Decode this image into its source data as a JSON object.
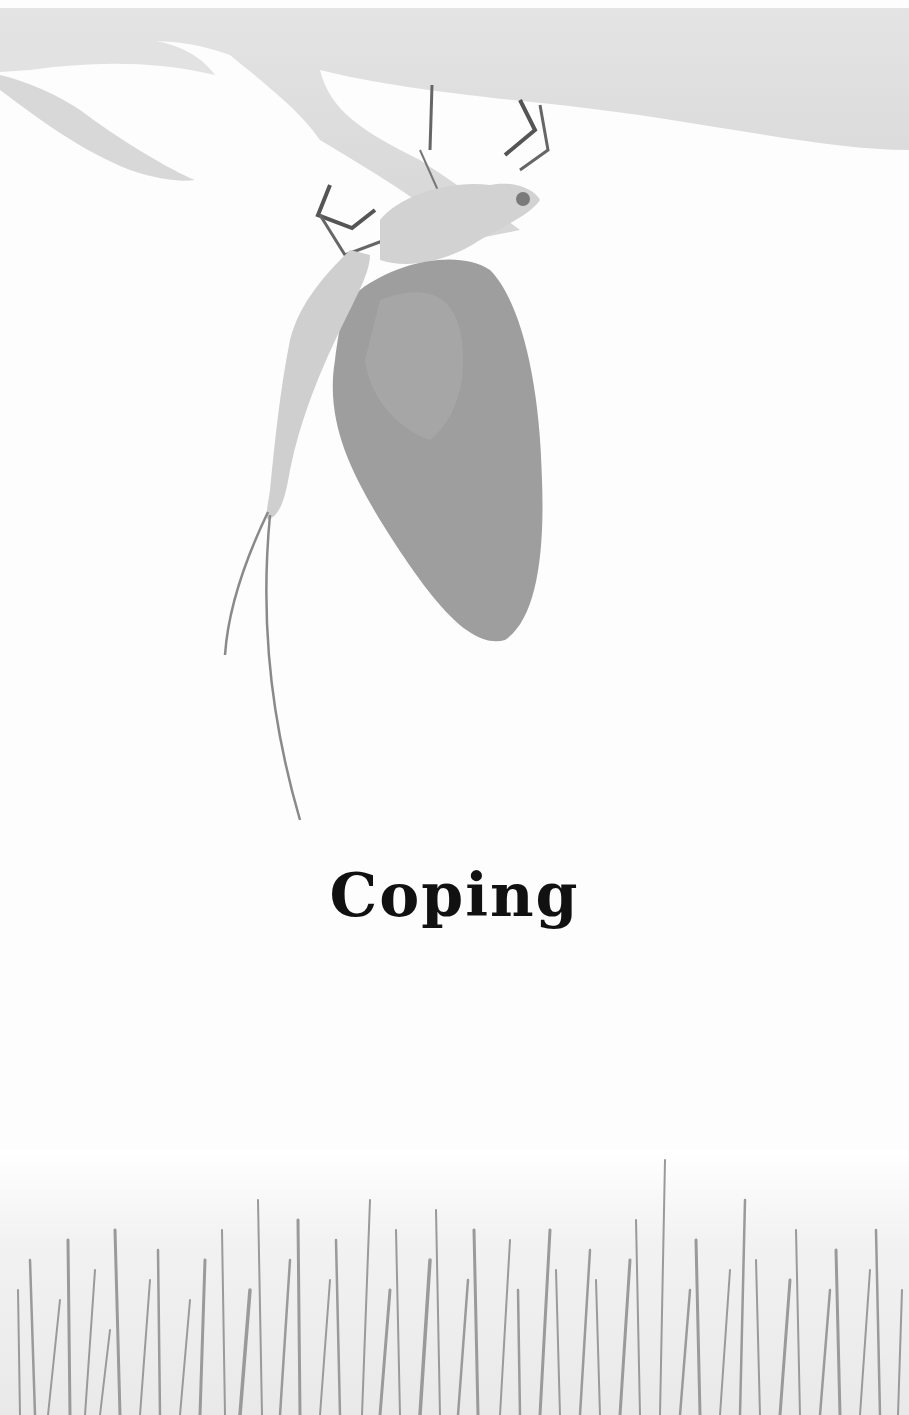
{
  "page": {
    "title": "Coping",
    "illustration": {
      "subject": "mayfly-hanging-from-leaf",
      "footer_scene": "reeds-in-water"
    },
    "colors": {
      "background": "#fdfdfd",
      "leaf": "#dcdcdc",
      "wing": "#9a9a9a",
      "body": "#c8c8c8",
      "reeds": "#8f8f8f",
      "title": "#111111"
    }
  }
}
